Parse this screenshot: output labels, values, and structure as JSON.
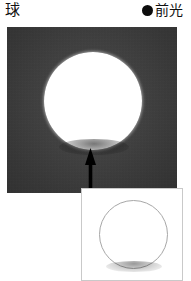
{
  "header": {
    "title": "球",
    "legend": {
      "marker": "filled-circle-marker",
      "label": "前光"
    }
  },
  "figure": {
    "main_panel": {
      "name": "front-lit sphere photograph",
      "background_color": "#3b3b3b",
      "subject": "球",
      "subject_color": "#ffffff",
      "lighting": "前光",
      "annotation": {
        "type": "arrow-up",
        "color": "#000000",
        "points_to": "球の下端"
      }
    },
    "inset_panel": {
      "name": "line drawing inset",
      "background_color": "#ffffff",
      "border_color": "#c9c9c9",
      "subject": "球",
      "outline_color": "#a7a7a7"
    }
  }
}
